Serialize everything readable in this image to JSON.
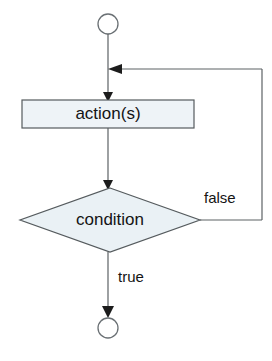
{
  "diagram": {
    "type": "flowchart",
    "background_color": "#ffffff",
    "nodes": [
      {
        "id": "start",
        "kind": "terminator-circle",
        "label": "",
        "fill": "#ffffff",
        "stroke": "#6a7074",
        "cx": 108,
        "cy": 24,
        "r": 10
      },
      {
        "id": "action",
        "kind": "process-rectangle",
        "label": "action(s)",
        "fill": "#eef3f7",
        "stroke": "#555b5e",
        "x": 22,
        "y": 100,
        "width": 172,
        "height": 28
      },
      {
        "id": "condition",
        "kind": "decision-diamond",
        "label": "condition",
        "fill": "#eaf1f5",
        "stroke": "#555b5e",
        "cx": 110,
        "cy": 220,
        "half_width": 90,
        "half_height": 32
      },
      {
        "id": "end",
        "kind": "terminator-circle",
        "label": "",
        "fill": "#ffffff",
        "stroke": "#6a7074",
        "cx": 108,
        "cy": 328,
        "r": 10
      }
    ],
    "edges": [
      {
        "id": "start-to-action",
        "from": "start",
        "to": "action",
        "label": "",
        "arrow": true
      },
      {
        "id": "action-to-condition",
        "from": "action",
        "to": "condition",
        "label": "",
        "arrow": true
      },
      {
        "id": "condition-false-loop",
        "from": "condition",
        "to": "action",
        "label": "false",
        "label_x": 204,
        "label_y": 199,
        "arrow": true
      },
      {
        "id": "condition-true-to-end",
        "from": "condition",
        "to": "end",
        "label": "true",
        "label_x": 118,
        "label_y": 278,
        "arrow": true
      }
    ],
    "labels": {
      "action_text": "action(s)",
      "condition_text": "condition",
      "false_text": "false",
      "true_text": "true"
    }
  }
}
